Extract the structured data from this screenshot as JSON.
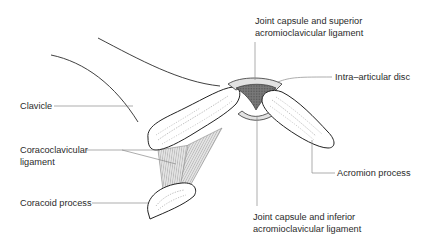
{
  "diagram": {
    "colors": {
      "outline": "#222222",
      "leader_line": "#8a8a8a",
      "disc_fill": "#6e6e6e",
      "capsule_fill": "#d9d9d9",
      "bone_fill": "#ffffff",
      "ligament_fill": "#d4d4d4",
      "text": "#2a2a2a"
    },
    "labels": {
      "clavicle": "Clavicle",
      "coracoclavicular_line1": "Coracoclavicular",
      "coracoclavicular_line2": "ligament",
      "coracoid_process": "Coracoid process",
      "superior_line1": "Joint capsule and superior",
      "superior_line2": "acromioclavicular ligament",
      "intra_articular_disc": "Intra–articular disc",
      "acromion_process": "Acromion process",
      "inferior_line1": "Joint capsule and inferior",
      "inferior_line2": "acromioclavicular ligament"
    }
  }
}
